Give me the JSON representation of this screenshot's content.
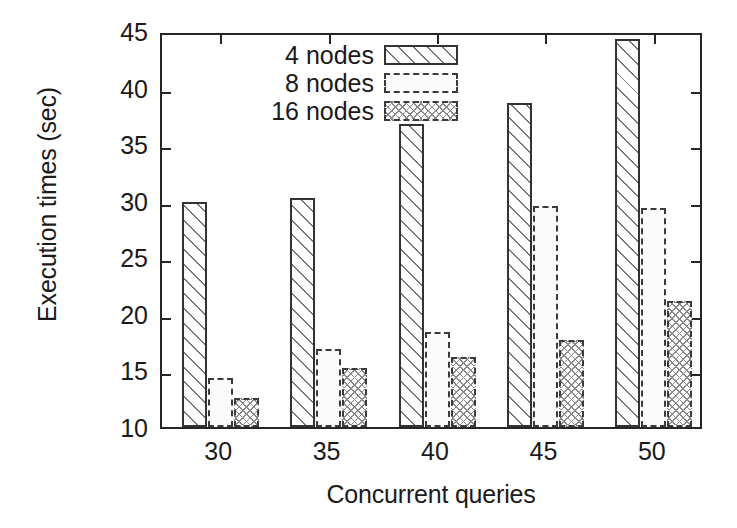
{
  "chart_data": {
    "type": "bar",
    "title": "",
    "xlabel": "Concurrent queries",
    "ylabel": "Execution times (sec)",
    "categories": [
      "30",
      "35",
      "40",
      "45",
      "50"
    ],
    "xtick_labels": [
      "30",
      "35",
      "40",
      "45",
      "50"
    ],
    "ytick_labels": [
      "10",
      "15",
      "20",
      "25",
      "30",
      "35",
      "40",
      "45"
    ],
    "ytick_values": [
      10,
      15,
      20,
      25,
      30,
      35,
      40,
      45
    ],
    "ylim": [
      10,
      45
    ],
    "grid": false,
    "legend_position": "upper-left",
    "series": [
      {
        "name": "4 nodes",
        "pattern": "diagonal-hatch",
        "values": [
          29.9,
          30.2,
          36.8,
          38.6,
          44.3
        ]
      },
      {
        "name": "8 nodes",
        "pattern": "dashed-outline",
        "values": [
          14.3,
          16.9,
          18.4,
          29.5,
          29.4
        ]
      },
      {
        "name": "16 nodes",
        "pattern": "crosshatch-dots",
        "values": [
          12.6,
          15.2,
          16.2,
          17.7,
          21.1
        ]
      }
    ]
  },
  "legend": {
    "entries": [
      {
        "label": "4 nodes"
      },
      {
        "label": "8 nodes"
      },
      {
        "label": "16 nodes"
      }
    ]
  },
  "axes": {
    "y_title": "Execution times (sec)",
    "x_title": "Concurrent queries"
  }
}
